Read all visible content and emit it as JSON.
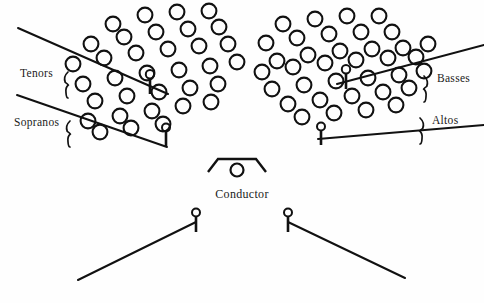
{
  "diagram": {
    "background_color": "#fefefe",
    "ink_color": "#111111",
    "width": 484,
    "height": 303
  },
  "labels": {
    "tenors": "Tenors",
    "sopranos": "Sopranos",
    "basses": "Basses",
    "altos": "Altos",
    "conductor": "Conductor"
  },
  "label_positions": {
    "tenors": {
      "x": 20,
      "y": 77
    },
    "sopranos": {
      "x": 14,
      "y": 126
    },
    "basses": {
      "x": 437,
      "y": 82
    },
    "altos": {
      "x": 432,
      "y": 124
    },
    "conductor": {
      "x": 242,
      "y": 198
    }
  },
  "braces": {
    "tenors": {
      "x": 68,
      "y": 72,
      "height": 26,
      "facing": "left"
    },
    "sopranos": {
      "x": 70,
      "y": 121,
      "height": 26,
      "facing": "left"
    },
    "basses": {
      "x": 424,
      "y": 76,
      "height": 26,
      "facing": "right"
    },
    "altos": {
      "x": 420,
      "y": 118,
      "height": 26,
      "facing": "right"
    }
  },
  "riser_lines": [
    {
      "name": "tenors-riser",
      "x1": 18,
      "y1": 28,
      "x2": 168,
      "y2": 94
    },
    {
      "name": "sopranos-riser",
      "x1": 17,
      "y1": 95,
      "x2": 167,
      "y2": 147
    },
    {
      "name": "basses-riser",
      "x1": 337,
      "y1": 84,
      "x2": 484,
      "y2": 45
    },
    {
      "name": "altos-riser",
      "x1": 318,
      "y1": 139,
      "x2": 484,
      "y2": 125
    },
    {
      "name": "front-left-riser",
      "x1": 78,
      "y1": 280,
      "x2": 196,
      "y2": 222
    },
    {
      "name": "front-right-riser",
      "x1": 288,
      "y1": 222,
      "x2": 405,
      "y2": 278
    }
  ],
  "microphones": [
    {
      "name": "mic-tenors",
      "x": 150,
      "y": 78,
      "post_height": 16,
      "head_r": 4.2
    },
    {
      "name": "mic-sopranos",
      "x": 166,
      "y": 131,
      "post_height": 15,
      "head_r": 4.0
    },
    {
      "name": "mic-basses",
      "x": 346,
      "y": 73,
      "post_height": 16,
      "head_r": 4.2
    },
    {
      "name": "mic-altos",
      "x": 321,
      "y": 130,
      "post_height": 15,
      "head_r": 4.0
    },
    {
      "name": "mic-front-left",
      "x": 196,
      "y": 216,
      "post_height": 16,
      "head_r": 4.0
    },
    {
      "name": "mic-front-right",
      "x": 288,
      "y": 216,
      "post_height": 16,
      "head_r": 4.0
    }
  ],
  "conductor_podium": {
    "name": "conductor-podium",
    "points": "208,172 218,159 256,159 266,172",
    "head": {
      "x": 237,
      "y": 170,
      "r": 6.5
    }
  },
  "singer_radius": 7.4,
  "left_choir": {
    "name": "left-choir-block",
    "section_upper": "Tenors",
    "section_lower": "Sopranos",
    "count": 35,
    "positions": [
      [
        113,
        24
      ],
      [
        145,
        15
      ],
      [
        177,
        12
      ],
      [
        209,
        11
      ],
      [
        91,
        44
      ],
      [
        124,
        37
      ],
      [
        156,
        32
      ],
      [
        188,
        29
      ],
      [
        219,
        27
      ],
      [
        73,
        64
      ],
      [
        104,
        58
      ],
      [
        136,
        53
      ],
      [
        168,
        49
      ],
      [
        199,
        46
      ],
      [
        228,
        44
      ],
      [
        83,
        84
      ],
      [
        115,
        78
      ],
      [
        147,
        73
      ],
      [
        179,
        70
      ],
      [
        210,
        66
      ],
      [
        237,
        62
      ],
      [
        95,
        101
      ],
      [
        127,
        96
      ],
      [
        159,
        92
      ],
      [
        190,
        88
      ],
      [
        218,
        84
      ],
      [
        88,
        121
      ],
      [
        120,
        116
      ],
      [
        152,
        111
      ],
      [
        183,
        106
      ],
      [
        211,
        102
      ],
      [
        100,
        132
      ],
      [
        131,
        128
      ],
      [
        163,
        124
      ]
    ]
  },
  "right_choir": {
    "name": "right-choir-block",
    "section_upper": "Basses",
    "section_lower": "Altos",
    "count": 35,
    "positions": [
      [
        283,
        24
      ],
      [
        315,
        19
      ],
      [
        347,
        16
      ],
      [
        379,
        16
      ],
      [
        266,
        43
      ],
      [
        297,
        38
      ],
      [
        329,
        34
      ],
      [
        361,
        32
      ],
      [
        392,
        32
      ],
      [
        277,
        61
      ],
      [
        308,
        55
      ],
      [
        340,
        51
      ],
      [
        372,
        49
      ],
      [
        403,
        48
      ],
      [
        428,
        44
      ],
      [
        262,
        72
      ],
      [
        293,
        67
      ],
      [
        325,
        63
      ],
      [
        356,
        60
      ],
      [
        388,
        58
      ],
      [
        416,
        57
      ],
      [
        272,
        89
      ],
      [
        304,
        85
      ],
      [
        336,
        81
      ],
      [
        368,
        78
      ],
      [
        399,
        75
      ],
      [
        424,
        71
      ],
      [
        288,
        104
      ],
      [
        320,
        100
      ],
      [
        352,
        96
      ],
      [
        383,
        92
      ],
      [
        409,
        88
      ],
      [
        302,
        117
      ],
      [
        334,
        113
      ],
      [
        366,
        110
      ],
      [
        396,
        105
      ]
    ]
  }
}
